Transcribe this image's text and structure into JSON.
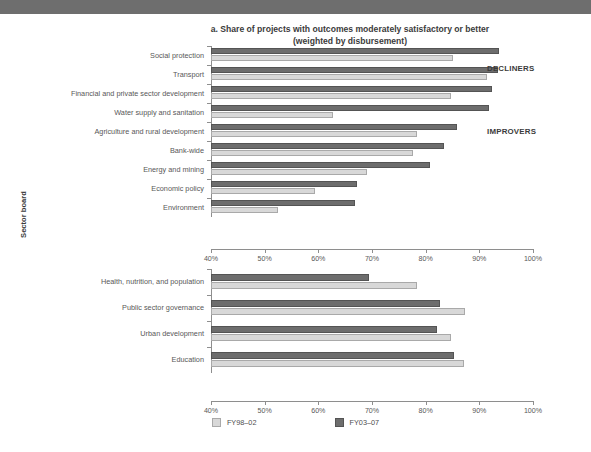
{
  "banner": {
    "name": "top-banner"
  },
  "chart_data": {
    "type": "bar",
    "orientation": "horizontal",
    "title": "a. Share of projects with outcomes moderately satisfactory or better",
    "subtitle": "(weighted by disbursement)",
    "xlabel": "",
    "ylabel": "Sector board",
    "xlim": [
      40,
      100
    ],
    "xticks": [
      40,
      50,
      60,
      70,
      80,
      90,
      100
    ],
    "xtick_labels": [
      "40%",
      "50%",
      "60%",
      "70%",
      "80%",
      "90%",
      "100%"
    ],
    "grid": false,
    "legend_position": "bottom-center",
    "legend": [
      {
        "name": "FY98–02",
        "color": "#d8d8d8"
      },
      {
        "name": "FY03–07",
        "color": "#6d6d6d"
      }
    ],
    "series": [
      {
        "name": "FY98–02",
        "color": "#d8d8d8"
      },
      {
        "name": "FY03–07",
        "color": "#6d6d6d"
      }
    ],
    "groups": [
      {
        "annotation": "IMPROVERS",
        "categories": [
          "Social protection",
          "Transport",
          "Financial and private sector development",
          "Water supply and sanitation",
          "Agriculture and rural development",
          "Bank-wide",
          "Energy and mining",
          "Economic policy",
          "Environment"
        ],
        "values": {
          "FY98–02": [
            85.1,
            91.5,
            84.8,
            62.8,
            78.4,
            77.7,
            69.0,
            59.4,
            52.4
          ],
          "FY03–07": [
            93.7,
            93.4,
            92.3,
            91.8,
            85.8,
            83.4,
            80.8,
            67.2,
            66.9
          ]
        }
      },
      {
        "annotation": "DECLINERS",
        "categories": [
          "Health, nutrition, and population",
          "Public sector governance",
          "Urban development",
          "Education"
        ],
        "values": {
          "FY98–02": [
            78.4,
            87.4,
            84.7,
            87.1
          ],
          "FY03–07": [
            69.4,
            82.7,
            82.1,
            85.2
          ]
        }
      }
    ]
  }
}
